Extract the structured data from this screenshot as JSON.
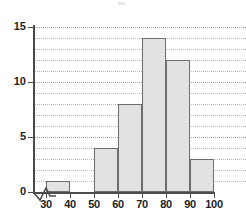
{
  "chart_data": {
    "type": "bar",
    "title": "",
    "subtitle": "",
    "xlabel": "",
    "ylabel": "",
    "categories": [
      "30-40",
      "40-50",
      "50-60",
      "60-70",
      "70-80",
      "80-90",
      "90-100"
    ],
    "bin_edges": [
      30,
      40,
      50,
      60,
      70,
      80,
      90,
      100
    ],
    "values": [
      1,
      0,
      4,
      8,
      14,
      12,
      3
    ],
    "bin_width": 10,
    "xlim": [
      30,
      100
    ],
    "ylim": [
      0,
      15
    ],
    "x_tick_labels": [
      "30",
      "40",
      "50",
      "60",
      "70",
      "80",
      "90",
      "100"
    ],
    "x_tick_values": [
      30,
      40,
      50,
      60,
      70,
      80,
      90,
      100
    ],
    "y_tick_labels": [
      "0",
      "5",
      "10",
      "15"
    ],
    "y_tick_values": [
      0,
      5,
      10,
      15
    ],
    "y_minor_tick_values": [
      1,
      2,
      3,
      4,
      6,
      7,
      8,
      9,
      11,
      12,
      13,
      14
    ],
    "grid": true,
    "grid_style": "dotted-horizontal",
    "legend": null,
    "axis_break": {
      "axis": "x",
      "symbol": "zigzag",
      "between": [
        0,
        30
      ]
    },
    "colors": {
      "bar_fill": "#e2e2e2",
      "bar_border": "#6d6d6d",
      "axis": "#4c4c4c",
      "grid": "#b9b9b9",
      "text": "#1e1e1e",
      "background": "#ffffff"
    }
  }
}
